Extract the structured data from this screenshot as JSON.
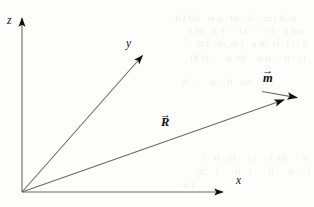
{
  "figure": {
    "kind": "vector-diagram",
    "width": 314,
    "height": 207,
    "background_color": "#fdfdfc",
    "stroke_color": "#5a5a5a",
    "ink_color": "#101010"
  },
  "axes": [
    {
      "name": "z",
      "label": "z",
      "from": [
        22,
        192
      ],
      "to": [
        22,
        14
      ],
      "arrow": true
    },
    {
      "name": "y",
      "label": "y",
      "from": [
        22,
        192
      ],
      "to": [
        147,
        50
      ],
      "arrow": true
    },
    {
      "name": "x",
      "label": "x",
      "from": [
        22,
        192
      ],
      "to": [
        228,
        192
      ],
      "arrow": true
    }
  ],
  "axis_labels": {
    "z": {
      "text": "z",
      "x": 7,
      "y": 20
    },
    "y": {
      "text": "y",
      "x": 126,
      "y": 44
    },
    "x": {
      "text": "x",
      "x": 236,
      "y": 182
    }
  },
  "vectors": [
    {
      "name": "R",
      "label": "R",
      "accent": "→",
      "accent_kind": "vector-arrow",
      "from": [
        22,
        192
      ],
      "to": [
        290,
        98
      ],
      "arrow": true,
      "label_pos": [
        161,
        118
      ]
    },
    {
      "name": "m",
      "label": "m",
      "accent": "→",
      "accent_kind": "vector-arrow",
      "from": [
        262,
        92
      ],
      "to": [
        303,
        99
      ],
      "arrow": true,
      "label_pos": [
        263,
        73
      ]
    }
  ],
  "bleed_through_lines": [
    {
      "text": "lr·,ll l nr· - il·, lrl ·,u m · rlll l il·,",
      "x": 18,
      "y": 12
    },
    {
      "text": "nrtl lr · ll · .-· il l · · l· rt ·llll l· ·",
      "x": 10,
      "y": 25
    },
    {
      "text": "ll ·,t l · rl ·llt n · l·lh, rlh ·l lll · ·",
      "x": 6,
      "y": 38
    },
    {
      "text": "l l · ll · ,·rt lr · ·lll· lr · · ·llt lll",
      "x": 8,
      "y": 52
    },
    {
      "text": "l · · nrl · ll · ·lt· · · · ll· ·",
      "x": 46,
      "y": 76
    },
    {
      "text": "ll · · ·llt· l · · l r · ·llt · lr · l ·",
      "x": 6,
      "y": 152
    },
    {
      "text": "l · · lr · · ll · ·· l · ll· · · l · ,lll·",
      "x": 4,
      "y": 166
    },
    {
      "text": "l·lr ·",
      "x": 120,
      "y": 179
    }
  ]
}
